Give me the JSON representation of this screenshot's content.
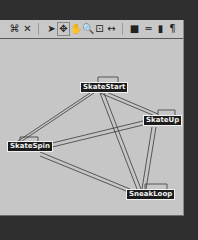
{
  "toolbar": {
    "icons": [
      {
        "name": "frame-all-icon",
        "glyph": "⌘"
      },
      {
        "name": "delete-icon",
        "glyph": "✕"
      },
      {
        "name": "select-arrow-icon",
        "glyph": "➤"
      },
      {
        "name": "move-icon",
        "glyph": "✥"
      },
      {
        "name": "pan-hand-icon",
        "glyph": "✋"
      },
      {
        "name": "zoom-icon",
        "glyph": "🔍"
      },
      {
        "name": "zoom-region-icon",
        "glyph": "⊡"
      },
      {
        "name": "zoom-extents-icon",
        "glyph": "↔"
      },
      {
        "name": "new-state-icon",
        "glyph": "■"
      },
      {
        "name": "transition-icon",
        "glyph": "═"
      },
      {
        "name": "cylinder-icon",
        "glyph": "▮"
      },
      {
        "name": "script-icon",
        "glyph": "¶"
      }
    ]
  },
  "graph": {
    "nodes": [
      {
        "id": "skatestart",
        "label": "SkateStart",
        "x": 80,
        "y": 43
      },
      {
        "id": "skateup",
        "label": "SkateUp",
        "x": 143,
        "y": 76
      },
      {
        "id": "skatespin",
        "label": "SkateSpin",
        "x": 7,
        "y": 102
      },
      {
        "id": "sneakloop",
        "label": "SneakLoop",
        "x": 126,
        "y": 150
      }
    ]
  }
}
